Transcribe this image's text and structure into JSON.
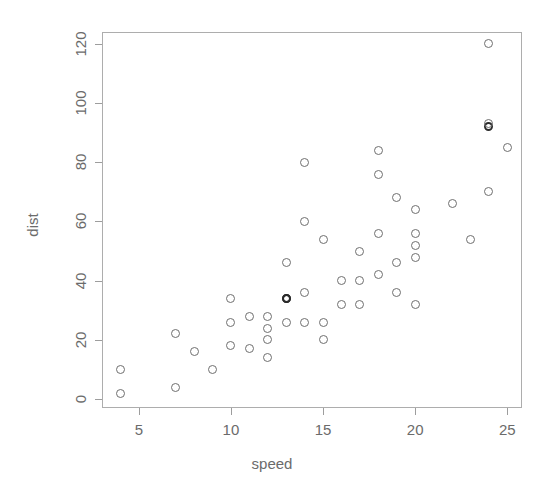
{
  "chart_data": {
    "type": "scatter",
    "title": "",
    "xlabel": "speed",
    "ylabel": "dist",
    "xlim": [
      3.0,
      25.8
    ],
    "ylim": [
      -3.0,
      124.0
    ],
    "xticks": [
      5,
      10,
      15,
      20,
      25
    ],
    "yticks": [
      0,
      20,
      40,
      60,
      80,
      100,
      120
    ],
    "xticklabels": [
      "5",
      "10",
      "15",
      "20",
      "25"
    ],
    "yticklabels": [
      "0",
      "20",
      "40",
      "60",
      "80",
      "100",
      "120"
    ],
    "grid": false,
    "legend": null,
    "marker": "open-circle",
    "marker_color": "#6f6f6f",
    "frame_color": "#adadad",
    "background": "#ffffff",
    "n_points": 50,
    "x": [
      4,
      4,
      7,
      7,
      8,
      9,
      10,
      10,
      10,
      11,
      11,
      12,
      12,
      12,
      12,
      13,
      13,
      13,
      13,
      14,
      14,
      14,
      14,
      15,
      15,
      15,
      16,
      16,
      17,
      17,
      17,
      18,
      18,
      18,
      18,
      19,
      19,
      19,
      20,
      20,
      20,
      20,
      20,
      22,
      23,
      24,
      24,
      24,
      24,
      25
    ],
    "y": [
      2,
      10,
      4,
      22,
      16,
      10,
      18,
      26,
      34,
      17,
      28,
      14,
      20,
      24,
      28,
      26,
      34,
      34,
      46,
      26,
      36,
      60,
      80,
      20,
      26,
      54,
      32,
      40,
      32,
      40,
      50,
      42,
      56,
      76,
      84,
      36,
      46,
      68,
      32,
      48,
      52,
      56,
      64,
      66,
      54,
      70,
      92,
      93,
      120,
      85
    ],
    "overlapping_points": [
      {
        "x": 13,
        "y": 34,
        "count": 2
      },
      {
        "x": 24,
        "y": 92,
        "count": 2
      }
    ]
  },
  "axes": {
    "x_title": "speed",
    "y_title": "dist"
  }
}
